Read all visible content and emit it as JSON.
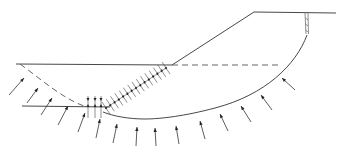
{
  "diagram": {
    "title": "",
    "type": "slope-stability-cross-section",
    "colors": {
      "line": "#333333",
      "background": "#ffffff"
    },
    "elements": {
      "crest_line": {
        "from": [
          254,
          12
        ],
        "to": [
          336,
          13
        ]
      },
      "slope_face": {
        "from": [
          254,
          12
        ],
        "to": [
          172,
          65
        ]
      },
      "upper_ground_line": {
        "from": [
          16,
          64
        ],
        "to": [
          172,
          65
        ]
      },
      "water_level_dashed": {
        "from": [
          172,
          65
        ],
        "to": [
          280,
          65
        ]
      },
      "tension_crack": {
        "top": [
          306,
          13
        ],
        "bottom": [
          307,
          36
        ]
      },
      "slip_surface_arc": "M307,36 C290,80 230,112 150,119 C130,120 115,115 103,112",
      "lower_ground_line": {
        "from": [
          22,
          106
        ],
        "to": [
          110,
          107
        ]
      },
      "phreatic_curve_dashed": "M20,64 C45,80 65,98 84,106",
      "hatched_drain_line": {
        "from": [
          106,
          108
        ],
        "to": [
          166,
          68
        ]
      },
      "vertical_drains_x": [
        88,
        95,
        101
      ]
    },
    "pore_pressure_arrows": [
      {
        "x1": 9,
        "y1": 95,
        "x2": 24,
        "y2": 78
      },
      {
        "x1": 27,
        "y1": 103,
        "x2": 38,
        "y2": 88
      },
      {
        "x1": 41,
        "y1": 115,
        "x2": 52,
        "y2": 98
      },
      {
        "x1": 58,
        "y1": 125,
        "x2": 68,
        "y2": 106
      },
      {
        "x1": 78,
        "y1": 132,
        "x2": 85,
        "y2": 113
      },
      {
        "x1": 96,
        "y1": 138,
        "x2": 100,
        "y2": 119
      },
      {
        "x1": 113,
        "y1": 143,
        "x2": 117,
        "y2": 124
      },
      {
        "x1": 136,
        "y1": 146,
        "x2": 137,
        "y2": 127
      },
      {
        "x1": 156,
        "y1": 146,
        "x2": 155,
        "y2": 128
      },
      {
        "x1": 179,
        "y1": 144,
        "x2": 176,
        "y2": 126
      },
      {
        "x1": 205,
        "y1": 139,
        "x2": 200,
        "y2": 121
      },
      {
        "x1": 228,
        "y1": 131,
        "x2": 220,
        "y2": 114
      },
      {
        "x1": 251,
        "y1": 122,
        "x2": 241,
        "y2": 106
      },
      {
        "x1": 272,
        "y1": 110,
        "x2": 261,
        "y2": 95
      },
      {
        "x1": 295,
        "y1": 90,
        "x2": 282,
        "y2": 78
      }
    ]
  }
}
